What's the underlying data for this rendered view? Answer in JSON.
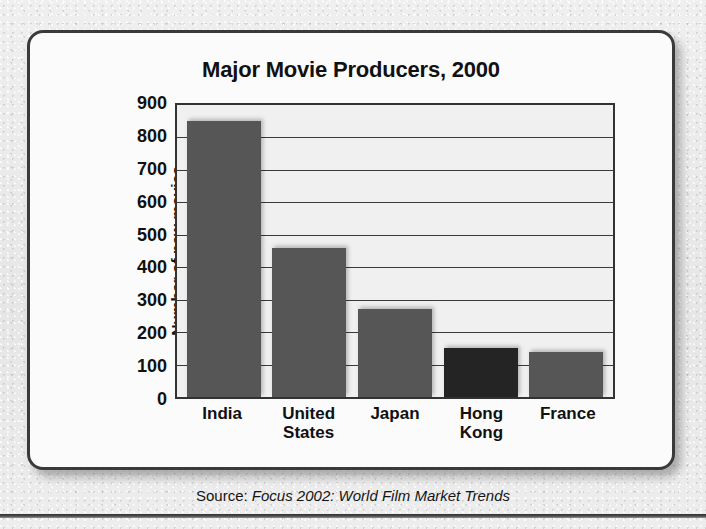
{
  "card": {
    "title": "Major Movie Producers, 2000"
  },
  "source": {
    "label": "Source: ",
    "title": "Focus 2002: World Film Market Trends"
  },
  "chart_data": {
    "type": "bar",
    "title": "Major Movie Producers, 2000",
    "xlabel": "",
    "ylabel": "Number of new movies\nproduced in 2000",
    "categories": [
      "India",
      "United States",
      "Japan",
      "Hong Kong",
      "France"
    ],
    "category_labels": [
      "India",
      "United\nStates",
      "Japan",
      "Hong\nKong",
      "France"
    ],
    "values": [
      850,
      460,
      270,
      150,
      140
    ],
    "ylim": [
      0,
      900
    ],
    "yticks": [
      900,
      800,
      700,
      600,
      500,
      400,
      300,
      200,
      100,
      0
    ],
    "grid": true,
    "legend": "none",
    "bar_colors": [
      "#565656",
      "#565656",
      "#565656",
      "#242424",
      "#565656"
    ]
  }
}
